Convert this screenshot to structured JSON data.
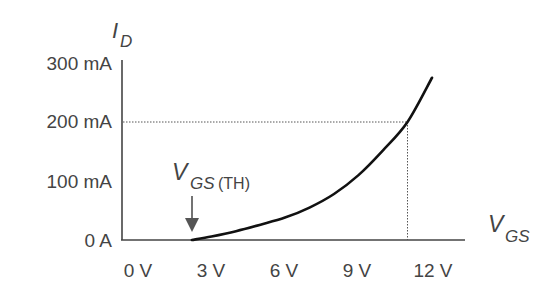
{
  "chart_data": {
    "type": "line",
    "title": "",
    "xlabel": "V_GS",
    "ylabel": "I_D",
    "xlabel_main": "V",
    "xlabel_sub": "GS",
    "ylabel_main": "I",
    "ylabel_sub": "D",
    "x_ticks": [
      "0 V",
      "3 V",
      "6 V",
      "9 V",
      "12 V"
    ],
    "x_tick_values": [
      0,
      3,
      6,
      9,
      12
    ],
    "y_ticks": [
      "0 A",
      "100 mA",
      "200 mA",
      "300 mA"
    ],
    "y_tick_values": [
      0,
      100,
      200,
      300
    ],
    "xlim": [
      0,
      13
    ],
    "ylim": [
      0,
      300
    ],
    "grid": false,
    "legend": null,
    "series": [
      {
        "name": "I_D vs V_GS",
        "x": [
          2.2,
          3,
          4,
          5,
          6,
          7,
          8,
          9,
          10,
          11,
          12
        ],
        "y": [
          0,
          6,
          15,
          26,
          38,
          55,
          78,
          110,
          152,
          200,
          275
        ]
      }
    ],
    "annotations": [
      {
        "text": "V_GS(TH)",
        "main": "V",
        "sub": "GS",
        "paren": "(TH)",
        "type": "arrow",
        "points_to_x": 2.2,
        "points_to_y": 0
      },
      {
        "type": "dotted-guide",
        "x": 11,
        "y": 200
      }
    ]
  }
}
